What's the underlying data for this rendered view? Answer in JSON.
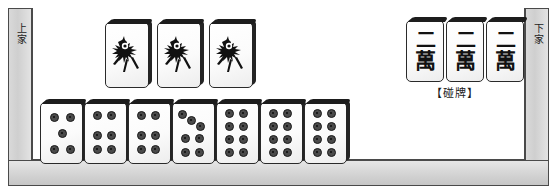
{
  "board": {
    "left_player_label": "上家",
    "right_player_label": "下家",
    "pung_caption": "【碰牌】"
  },
  "melds": {
    "bamboo_meld": {
      "tile_label": "一索",
      "icon": "sparrow-icon",
      "count": 3,
      "tiles": [
        "一索",
        "一索",
        "一索"
      ]
    },
    "character_meld": {
      "tile_top": "二",
      "tile_bottom": "萬",
      "count": 3,
      "tiles": [
        "二萬",
        "二萬",
        "二萬"
      ],
      "caption": "【碰牌】"
    }
  },
  "hand": {
    "label": "手牌",
    "tiles": [
      {
        "name": "五筒",
        "suit": "dots",
        "value": 5
      },
      {
        "name": "六筒",
        "suit": "dots",
        "value": 6
      },
      {
        "name": "六筒",
        "suit": "dots",
        "value": 6
      },
      {
        "name": "七筒",
        "suit": "dots",
        "value": 7
      },
      {
        "name": "八筒",
        "suit": "dots",
        "value": 8
      },
      {
        "name": "八筒",
        "suit": "dots",
        "value": 8
      },
      {
        "name": "八筒",
        "suit": "dots",
        "value": 8
      }
    ]
  },
  "colors": {
    "frame_border": "#4a4a4a",
    "bar_fill": "#d6d6d6",
    "tile_face": "#fbfbfb",
    "tile_edge": "#1d1d1d",
    "ink": "#1a1a1a"
  }
}
